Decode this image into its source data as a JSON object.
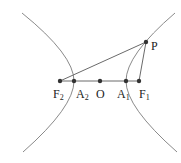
{
  "diagram": {
    "type": "hyperbola",
    "points": {
      "P": {
        "label": "P",
        "sub": "",
        "x": 146,
        "y": 42
      },
      "F2": {
        "label": "F",
        "sub": "2",
        "x": 60,
        "y": 81
      },
      "A2": {
        "label": "A",
        "sub": "2",
        "x": 74,
        "y": 81
      },
      "O": {
        "label": "O",
        "sub": "",
        "x": 100,
        "y": 81
      },
      "A1": {
        "label": "A",
        "sub": "1",
        "x": 126,
        "y": 81
      },
      "F1": {
        "label": "F",
        "sub": "1",
        "x": 139,
        "y": 81
      }
    },
    "segments": [
      "F2-P",
      "P-F1",
      "F2-F1"
    ],
    "colors": {
      "curve": "#8a8a8a",
      "line": "#6a6a6a",
      "point": "#333333"
    }
  }
}
